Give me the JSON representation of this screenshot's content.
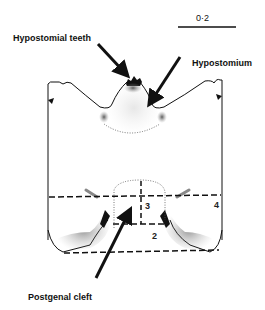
{
  "figure": {
    "scale_bar": {
      "label": "0·2"
    },
    "labels": {
      "hypostomial_teeth": "Hypostomial teeth",
      "hypostomium": "Hypostomium",
      "postgenal_cleft": "Postgenal cleft"
    },
    "regions": [
      "2",
      "3",
      "4"
    ]
  }
}
